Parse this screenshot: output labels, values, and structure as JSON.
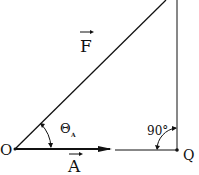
{
  "diagram": {
    "type": "vector-triangle",
    "points": {
      "origin": {
        "label": "O"
      },
      "foot": {
        "label": "Q"
      }
    },
    "vectors": {
      "F": {
        "label": "F",
        "arrow": "→"
      },
      "A": {
        "label": "A",
        "arrow": "→"
      }
    },
    "angles": {
      "theta": {
        "label": "Θ",
        "subscript": "A"
      },
      "right": {
        "label": "90°"
      }
    },
    "colors": {
      "stroke": "#111111",
      "background": "#ffffff"
    }
  }
}
